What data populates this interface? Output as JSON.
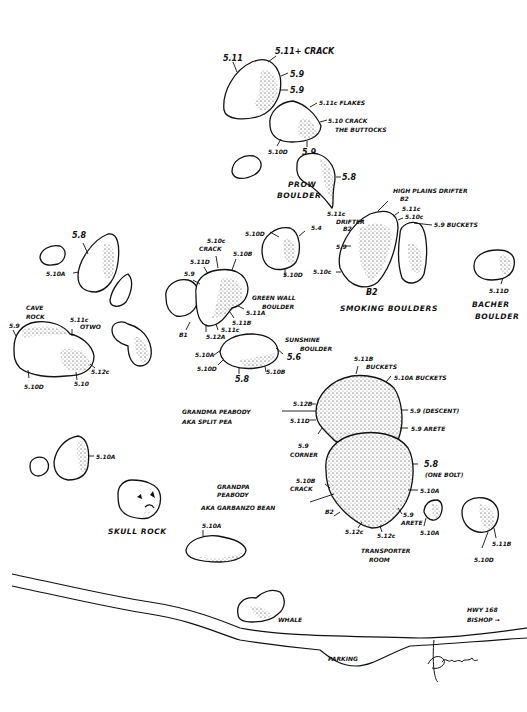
{
  "map": {
    "title": "Bouldering topo map",
    "background": "#ffffff",
    "ink": "#111111"
  },
  "boulders": [
    {
      "id": "b1",
      "name": "",
      "problems": [
        "5.11",
        "5.11+ CRACK",
        "5.9",
        "5.9"
      ]
    },
    {
      "id": "b2",
      "name": "",
      "problems": [
        "5.11c FLAKES",
        "5.10 CRACK",
        "5.10D",
        "5.9"
      ],
      "notes": [
        "THE BUTTOCKS"
      ]
    },
    {
      "id": "prow",
      "name": "PROW BOULDER",
      "problems": [
        "5.8",
        "5.11c"
      ]
    },
    {
      "id": "smoking",
      "name": "SMOKING BOULDERS",
      "problems": [
        "HIGH PLAINS DRIFTER",
        "B2",
        "5.11c",
        "5.10c",
        "5.9 BUCKETS",
        "DRIFTER",
        "B2",
        "5.9",
        "5.10c",
        "B2"
      ]
    },
    {
      "id": "b5",
      "name": "",
      "problems": [
        "5.10D",
        "5.4",
        "5.10D"
      ]
    },
    {
      "id": "greenwall",
      "name": "GREEN WALL BOULDER",
      "problems": [
        "5.10c",
        "CRACK",
        "5.10B",
        "5.11D",
        "5.9",
        "5.11A",
        "5.11B",
        "5.11c",
        "5.12A",
        "B1"
      ]
    },
    {
      "id": "bacher",
      "name": "BACHER BOULDER",
      "problems": [
        "5.11D"
      ]
    },
    {
      "id": "b8",
      "name": "",
      "problems": [
        "5.8",
        "5.10A"
      ]
    },
    {
      "id": "cave",
      "name": "CAVE ROCK",
      "problems": [
        "5.9",
        "5.11c",
        "OTWO",
        "5.10D",
        "5.10",
        "5.12c"
      ]
    },
    {
      "id": "sunshine",
      "name": "SUNSHINE BOULDER",
      "problems": [
        "5.10A",
        "5.10D",
        "5.8",
        "5.10B",
        "5.6"
      ]
    },
    {
      "id": "grandma",
      "name": "GRANDMA PEABODY",
      "aka": "AKA SPLIT PEA",
      "problems": [
        "5.11B",
        "BUCKETS",
        "5.10A BUCKETS",
        "5.12B",
        "5.11D",
        "5.9 (DESCENT)",
        "5.9 ARETE",
        "5.9",
        "CORNER"
      ]
    },
    {
      "id": "grandpa",
      "name": "GRANDPA PEABODY",
      "aka": "AKA GARBANZO BEAN",
      "problems": [
        "5.8",
        "(ONE BOLT)",
        "5.10B",
        "CRACK",
        "5.10A",
        "B2",
        "5.9",
        "ARETE",
        "5.12c",
        "5.12c"
      ]
    },
    {
      "id": "transporter",
      "name": "TRANSPORTER ROOM",
      "problems": []
    },
    {
      "id": "b13",
      "name": "",
      "problems": [
        "5.10A"
      ]
    },
    {
      "id": "b14",
      "name": "",
      "problems": [
        "5.11B",
        "5.10D"
      ]
    },
    {
      "id": "b15",
      "name": "",
      "problems": [
        "5.10A"
      ]
    },
    {
      "id": "skull",
      "name": "SKULL ROCK",
      "problems": []
    },
    {
      "id": "b17",
      "name": "",
      "problems": [
        "5.10A"
      ]
    },
    {
      "id": "whale",
      "name": "WHALE",
      "problems": []
    }
  ],
  "labels": {
    "b1_a": "5.11",
    "b1_b": "5.11+ CRACK",
    "b1_c": "5.9",
    "b1_d": "5.9",
    "b2_a": "5.11c FLAKES",
    "b2_b": "5.10 CRACK",
    "b2_c": "THE BUTTOCKS",
    "b2_d": "5.10D",
    "b2_e": "5.9",
    "prow_a": "5.8",
    "prow_name1": "PROW",
    "prow_name2": "BOULDER",
    "prow_b": "5.11c",
    "sm_a": "HIGH PLAINS DRIFTER",
    "sm_b": "B2",
    "sm_c": "5.11c",
    "sm_d": "5.10c",
    "sm_e": "5.9 BUCKETS",
    "sm_f": "DRIFTER",
    "sm_g": "B2",
    "sm_h": "5.9",
    "sm_i": "5.10c",
    "sm_j": "B2",
    "sm_name": "SMOKING BOULDERS",
    "b5_a": "5.10D",
    "b5_b": "5.4",
    "b5_c": "5.10D",
    "gw_a": "5.10c",
    "gw_b": "CRACK",
    "gw_c": "5.10B",
    "gw_d": "5.11D",
    "gw_e": "5.9",
    "gw_f": "5.11A",
    "gw_g": "5.11B",
    "gw_h": "5.11c",
    "gw_i": "5.12A",
    "gw_j": "B1",
    "gw_name1": "GREEN WALL",
    "gw_name2": "BOULDER",
    "bach_a": "5.11D",
    "bach_name1": "BACHER",
    "bach_name2": "BOULDER",
    "b8_a": "5.8",
    "b8_b": "5.10A",
    "cave_name1": "CAVE",
    "cave_name2": "ROCK",
    "cave_a": "5.9",
    "cave_b": "5.11c",
    "cave_c": "OTWO",
    "cave_d": "5.10D",
    "cave_e": "5.10",
    "cave_f": "5.12c",
    "sun_name1": "SUNSHINE",
    "sun_name2": "BOULDER",
    "sun_a": "5.10A",
    "sun_b": "5.10D",
    "sun_c": "5.8",
    "sun_d": "5.10B",
    "sun_e": "5.6",
    "gm_a": "5.11B",
    "gm_b": "BUCKETS",
    "gm_c": "5.10A BUCKETS",
    "gm_d": "5.12B",
    "gm_e": "5.11D",
    "gm_f": "5.9 (DESCENT)",
    "gm_g": "5.9 ARETE",
    "gm_h": "5.9",
    "gm_i": "CORNER",
    "gm_name1": "GRANDMA PEABODY",
    "gm_name2": "AKA SPLIT PEA",
    "gp_a": "5.8",
    "gp_b": "(ONE BOLT)",
    "gp_c": "5.10B",
    "gp_d": "CRACK",
    "gp_e": "5.10A",
    "gp_f": "B2",
    "gp_g": "5.9",
    "gp_h": "ARETE",
    "gp_i": "5.12c",
    "gp_j": "5.12c",
    "gp_name1": "GRANDPA",
    "gp_name2": "PEABODY",
    "gp_name3": "AKA GARBANZO BEAN",
    "tr_name1": "TRANSPORTER",
    "tr_name2": "ROOM",
    "b13_a": "5.10A",
    "b14_a": "5.11B",
    "b14_b": "5.10D",
    "b15_a": "5.10A",
    "skull_name": "SKULL ROCK",
    "b17_a": "5.10A",
    "whale_name": "WHALE",
    "road_a": "HWY 168",
    "road_b": "BISHOP →",
    "parking": "PARKING",
    "signature": "D. Lewis"
  }
}
